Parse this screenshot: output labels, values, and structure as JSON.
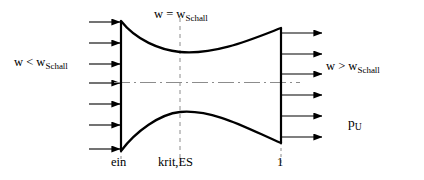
{
  "diagram": {
    "colors": {
      "wall": "#000000",
      "arrow": "#000000",
      "centerline": "#8c8c8c",
      "station_dash": "#8c8c8c",
      "background": "#ffffff"
    },
    "labels": {
      "inlet_flow": {
        "symbol": "w",
        "relation": "<",
        "reference": "w",
        "reference_sub": "Schall"
      },
      "throat_flow": {
        "symbol": "w",
        "relation": "=",
        "reference": "w",
        "reference_sub": "Schall"
      },
      "exit_flow": {
        "symbol": "w",
        "relation": ">",
        "reference": "w",
        "reference_sub": "Schall"
      },
      "ambient_pressure": {
        "symbol": "p",
        "symbol_sub": "U"
      }
    },
    "stations": [
      {
        "name": "inlet",
        "label": "ein",
        "x": 121
      },
      {
        "name": "throat",
        "label": "krit,ES",
        "x": 180
      },
      {
        "name": "exit",
        "label": "1",
        "x": 281
      }
    ],
    "arrows": {
      "inlet_count": 7,
      "exit_count": 6
    }
  }
}
